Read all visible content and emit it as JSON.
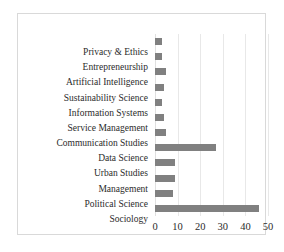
{
  "chart_data": {
    "type": "bar",
    "orientation": "horizontal",
    "title": "",
    "subtitle": "",
    "xlabel": "",
    "ylabel": "",
    "xlim": [
      0,
      50
    ],
    "grid": true,
    "legend": false,
    "legend_position": "none",
    "bar_color": "#808080",
    "gridline_color": "#e8e8e8",
    "border_color": "#d9d9d9",
    "xticks": [
      0,
      10,
      20,
      30,
      40,
      50
    ],
    "xtick_labels": [
      "0",
      "10",
      "20",
      "30",
      "40",
      "50"
    ],
    "categories": [
      "Privacy & Ethics",
      "Entrepreneurship",
      "Artificial Intelligence",
      "Sustainability Science",
      "Information Systems",
      "Service Management",
      "Communication Studies",
      "Data Science",
      "Urban Studies",
      "Management",
      "Political Science",
      "Sociology"
    ],
    "values": [
      3,
      3,
      5,
      4,
      3,
      4,
      5,
      27,
      9,
      9,
      8,
      46
    ]
  }
}
